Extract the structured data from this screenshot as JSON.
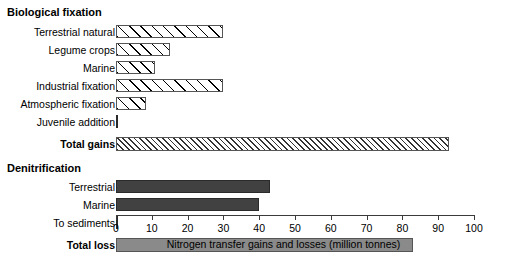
{
  "chart_data": {
    "type": "bar",
    "orientation": "horizontal",
    "title": "",
    "xlabel": "Nitrogen transfer gains and losses (million tonnes)",
    "ylabel": "",
    "xlim": [
      0,
      100
    ],
    "xticks": [
      0,
      10,
      20,
      30,
      40,
      50,
      60,
      70,
      80,
      90,
      100
    ],
    "xtick_labels": [
      "0",
      "10",
      "20",
      "30",
      "40",
      "50",
      "60",
      "70",
      "80",
      "90",
      "100"
    ],
    "grid": false,
    "legend": false,
    "groups": [
      {
        "name": "Biological fixation",
        "categories": [
          "Terrestrial natural",
          "Legume crops",
          "Marine",
          "Industrial fixation",
          "Atmospheric fixation",
          "Juvenile addition"
        ],
        "values": [
          30,
          15,
          11,
          30,
          8.5,
          0.2
        ],
        "total_label": "Total gains",
        "total_value": 93
      },
      {
        "name": "Denitrification",
        "categories": [
          "Terrestrial",
          "Marine",
          "To sediments"
        ],
        "values": [
          43,
          40,
          0.2
        ],
        "total_label": "Total loss",
        "total_value": 83
      }
    ],
    "styles": {
      "biological_bar_fill": "hatch-open",
      "total_gains_fill": "hatch-dense",
      "denitrification_bar_fill": "#414141",
      "total_loss_fill": "#8a8a8a",
      "bar_outline": "#555555",
      "axis_color": "#3b3b3b",
      "background": "#ffffff"
    }
  },
  "sections": {
    "biological": {
      "heading": "Biological fixation"
    },
    "denitrification": {
      "heading": "Denitrification"
    }
  },
  "rows": {
    "terrestrial_natural": {
      "label": "Terrestrial natural",
      "value": 30
    },
    "legume_crops": {
      "label": "Legume crops",
      "value": 15
    },
    "marine_fix": {
      "label": "Marine",
      "value": 11
    },
    "industrial_fixation": {
      "label": "Industrial fixation",
      "value": 30
    },
    "atmospheric_fixation": {
      "label": "Atmospheric fixation",
      "value": 8.5
    },
    "juvenile_addition": {
      "label": "Juvenile addition",
      "value": 0.2
    },
    "total_gains": {
      "label": "Total gains",
      "value": 93
    },
    "terrestrial_den": {
      "label": "Terrestrial",
      "value": 43
    },
    "marine_den": {
      "label": "Marine",
      "value": 40
    },
    "to_sediments": {
      "label": "To sediments",
      "value": 0.2
    },
    "total_loss": {
      "label": "Total loss",
      "value": 83
    }
  },
  "axis": {
    "title": "Nitrogen transfer gains and losses (million tonnes)",
    "ticks": [
      "0",
      "10",
      "20",
      "30",
      "40",
      "50",
      "60",
      "70",
      "80",
      "90",
      "100"
    ]
  }
}
